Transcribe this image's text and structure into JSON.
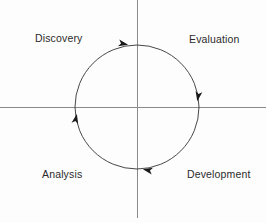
{
  "diagram": {
    "type": "cycle",
    "direction": "clockwise",
    "background_color": "#fdfdfd",
    "axis_color": "#8a8a8a",
    "circle_color": "#333333",
    "text_color": "#2b2b2b",
    "center": {
      "x": 137,
      "y": 107
    },
    "radius": 62,
    "axes": {
      "vertical": {
        "x": 137,
        "y_start": 0,
        "y_end": 218
      },
      "horizontal": {
        "y": 107,
        "x_start": 0,
        "x_end": 266
      }
    },
    "labels": [
      {
        "id": "discovery",
        "text": "Discovery",
        "quadrant": "top-left"
      },
      {
        "id": "evaluation",
        "text": "Evaluation",
        "quadrant": "top-right"
      },
      {
        "id": "analysis",
        "text": "Analysis",
        "quadrant": "bottom-left"
      },
      {
        "id": "development",
        "text": "Development",
        "quadrant": "bottom-right"
      }
    ],
    "arrows": [
      {
        "id": "arrow-top",
        "x": 124,
        "y": 43,
        "angle": 12,
        "points": "right"
      },
      {
        "id": "arrow-right",
        "x": 198,
        "y": 97,
        "angle": 100,
        "points": "down"
      },
      {
        "id": "arrow-bottom",
        "x": 147,
        "y": 170,
        "angle": 192,
        "points": "left"
      },
      {
        "id": "arrow-left",
        "x": 76,
        "y": 118,
        "angle": 282,
        "points": "up"
      }
    ]
  }
}
